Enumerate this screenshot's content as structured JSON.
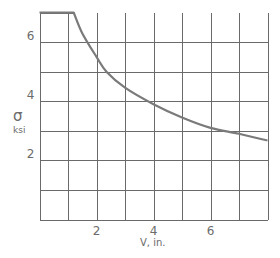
{
  "chart_data": {
    "type": "line",
    "title": "",
    "xlabel": "V, in.",
    "ylabel": "σ",
    "ylabel_units": "ksi",
    "xlim": [
      0,
      8
    ],
    "ylim": [
      0,
      7
    ],
    "grid": true,
    "x_grid_step": 1,
    "y_grid_step": 1,
    "x_tick_labels": [
      "2",
      "4",
      "6"
    ],
    "x_tick_values": [
      2,
      4,
      6
    ],
    "y_tick_labels": [
      "2",
      "4",
      "6"
    ],
    "y_tick_values": [
      2,
      4,
      6
    ],
    "legend": null,
    "series": [
      {
        "name": "σ vs V",
        "x": [
          0,
          1.2,
          1.5,
          2,
          2.35,
          3,
          4,
          5,
          6,
          7,
          8
        ],
        "y": [
          7,
          7,
          6.3,
          5.5,
          5,
          4.46,
          3.9,
          3.45,
          3.1,
          2.9,
          2.67
        ]
      }
    ]
  }
}
